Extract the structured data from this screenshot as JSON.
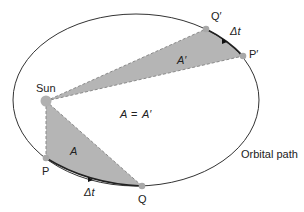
{
  "diagram": {
    "orbit": {
      "label": "Orbital path",
      "cx": 136,
      "cy": 100,
      "rx": 123,
      "ry": 86,
      "stroke": "#333333"
    },
    "sun": {
      "label": "Sun",
      "x": 46,
      "y": 101,
      "r": 5.5,
      "color": "#b0b0b0"
    },
    "points": [
      {
        "id": "P",
        "label": "P",
        "x": 46,
        "y": 158
      },
      {
        "id": "Q",
        "label": "Q",
        "x": 142,
        "y": 186
      },
      {
        "id": "P2",
        "label": "P′",
        "x": 243,
        "y": 56
      },
      {
        "id": "Q2",
        "label": "Q′",
        "x": 206,
        "y": 29
      }
    ],
    "areas": [
      {
        "id": "A",
        "label": "A"
      },
      {
        "id": "A2",
        "label": "A′"
      }
    ],
    "equation": {
      "lhs": "A",
      "op": "=",
      "rhs": "A′"
    },
    "time_labels": {
      "lower": "Δt",
      "upper": "Δt"
    },
    "colors": {
      "shade": "#b5b5b5",
      "dash": "#8a8a8a",
      "point": "#a8a8a8",
      "text": "#222222"
    }
  }
}
